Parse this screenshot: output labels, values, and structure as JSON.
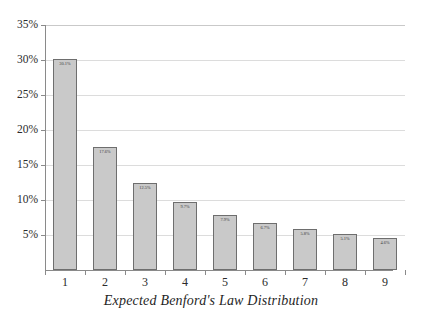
{
  "chart_data": {
    "type": "bar",
    "title": "Expected Benford's Law Distribution",
    "xlabel": "",
    "ylabel": "",
    "categories": [
      "1",
      "2",
      "3",
      "4",
      "5",
      "6",
      "7",
      "8",
      "9"
    ],
    "values": [
      30.1,
      17.6,
      12.5,
      9.7,
      7.9,
      6.7,
      5.8,
      5.1,
      4.6
    ],
    "value_labels": [
      "30.1%",
      "17.6%",
      "12.5%",
      "9.7%",
      "7.9%",
      "6.7%",
      "5.8%",
      "5.1%",
      "4.6%"
    ],
    "ylim": [
      0,
      35
    ],
    "y_ticks": [
      35,
      30,
      25,
      20,
      15,
      10,
      5
    ],
    "y_tick_labels": [
      "35%",
      "30%",
      "25%",
      "20%",
      "15%",
      "10%",
      "5%"
    ],
    "grid": true,
    "legend": false,
    "legend_position": "none",
    "colors": {
      "bar_fill": "#c9c9c9",
      "bar_border": "#6e6e6e",
      "gridline": "#dcdcdc",
      "axis": "#8a8a8a",
      "text": "#2b2b2b",
      "background": "#ffffff"
    }
  }
}
